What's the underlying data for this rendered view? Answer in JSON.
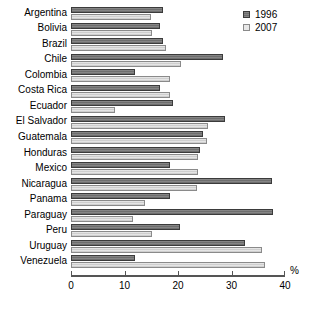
{
  "chart_data": {
    "type": "bar",
    "orientation": "horizontal",
    "title": "",
    "xlabel": "%",
    "ylabel": "",
    "xlim": [
      0,
      40
    ],
    "xticks": [
      0,
      10,
      20,
      30,
      40
    ],
    "grid": false,
    "legend_position": "top-right",
    "categories": [
      "Argentina",
      "Bolivia",
      "Brazil",
      "Chile",
      "Colombia",
      "Costa Rica",
      "Ecuador",
      "El Salvador",
      "Guatemala",
      "Honduras",
      "Mexico",
      "Nicaragua",
      "Panama",
      "Paraguay",
      "Peru",
      "Uruguay",
      "Venezuela"
    ],
    "series": [
      {
        "name": "1996",
        "color": "#6e6e6e",
        "values": [
          17.2,
          16.6,
          17.2,
          28.4,
          12.0,
          16.6,
          19.1,
          28.8,
          24.7,
          24.1,
          18.5,
          37.6,
          18.5,
          37.8,
          20.4,
          32.6,
          12.0
        ]
      },
      {
        "name": "2007",
        "color": "#cfcfcf",
        "values": [
          15.0,
          15.1,
          17.8,
          20.6,
          18.5,
          18.5,
          8.2,
          25.6,
          25.4,
          23.8,
          23.8,
          23.5,
          13.8,
          11.6,
          15.1,
          35.7,
          36.2
        ]
      }
    ]
  },
  "legend": {
    "entries": [
      {
        "label": "1996"
      },
      {
        "label": "2007"
      }
    ]
  },
  "axis": {
    "unit_label": "%",
    "tick_labels": [
      "0",
      "10",
      "20",
      "30",
      "40"
    ]
  }
}
